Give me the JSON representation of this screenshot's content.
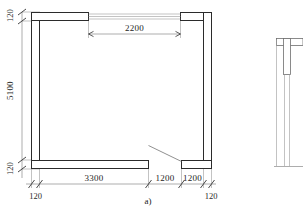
{
  "drawing": {
    "figure_label": "a)",
    "type": "architectural-floor-plan",
    "units_note": "mm",
    "dimensions": {
      "top": [
        {
          "id": "opening-top",
          "value": "2200",
          "orientation": "horizontal",
          "tick_style": "arrow"
        }
      ],
      "left": [
        {
          "id": "wall-thk-top",
          "value": "120",
          "orientation": "vertical",
          "tick_style": "slash"
        },
        {
          "id": "interior-height",
          "value": "5100",
          "orientation": "vertical",
          "tick_style": "slash"
        },
        {
          "id": "wall-thk-bottom",
          "value": "120",
          "orientation": "vertical",
          "tick_style": "slash"
        }
      ],
      "bottom": [
        {
          "id": "wall-thk-left",
          "value": "120",
          "orientation": "horizontal",
          "tick_style": "slash"
        },
        {
          "id": "seg-3300",
          "value": "3300",
          "orientation": "horizontal",
          "tick_style": "slash"
        },
        {
          "id": "seg-1200-a",
          "value": "1200",
          "orientation": "horizontal",
          "tick_style": "slash"
        },
        {
          "id": "seg-1200-b",
          "value": "1200",
          "orientation": "horizontal",
          "tick_style": "slash"
        },
        {
          "id": "wall-thk-right",
          "value": "120",
          "orientation": "horizontal",
          "tick_style": "slash"
        }
      ]
    },
    "features": [
      {
        "id": "top-window",
        "name": "window-opening",
        "width_label": "2200"
      },
      {
        "id": "bottom-door",
        "name": "door-opening-with-swing"
      }
    ],
    "adjacent_figure": {
      "id": "figure-b-partial",
      "name": "partial-second-plan",
      "cropped": true
    }
  },
  "colors": {
    "wall_stroke": "#2b2b2b",
    "wall_fill": "#ffffff",
    "dim_line": "#8a8a8a",
    "text": "#252525",
    "background": "#ffffff"
  }
}
